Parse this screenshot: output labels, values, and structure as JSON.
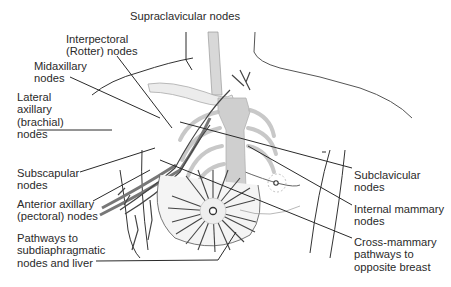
{
  "diagram": {
    "labels": {
      "supraclavicular": "Supraclavicular nodes",
      "interpectoral": "Interpectoral\n(Rotter) nodes",
      "midaxillary": "Midaxillary\nnodes",
      "lateral_axillary": "Lateral\naxillary\n(brachial)\nnodes",
      "subscapular": "Subscapular\nnodes",
      "anterior_axillary": "Anterior axillary\n(pectoral) nodes",
      "pathways_subdiaphragmatic": "Pathways to\nsubdiaphragmatic\nnodes and liver",
      "subclavicular": "Subclavicular\nnodes",
      "internal_mammary": "Internal mammary\nnodes",
      "cross_mammary": "Cross-mammary\npathways to\nopposite breast"
    },
    "colors": {
      "line": "#2a2a2a",
      "bone": "#e6e6e6",
      "sternum": "#cfcfcf",
      "lymph": "#555555",
      "body_outline": "#333333"
    }
  }
}
